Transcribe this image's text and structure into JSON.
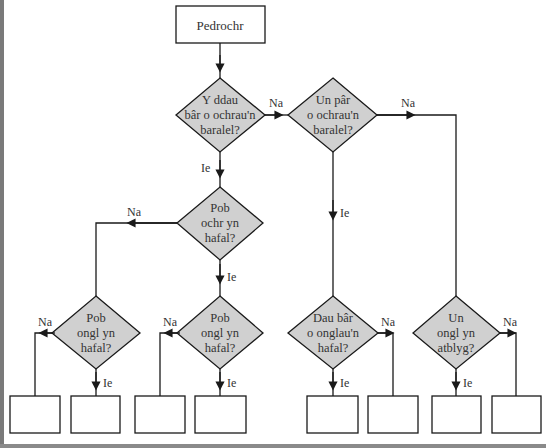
{
  "diagram": {
    "start": {
      "label": "Pedrochr"
    },
    "decisions": [
      {
        "id": "d1",
        "lines": [
          "Y ddau",
          "bâr o ochrau'n",
          "baralel?"
        ]
      },
      {
        "id": "d2",
        "lines": [
          "Un pâr",
          "o ochrau'n",
          "baralel?"
        ]
      },
      {
        "id": "d3",
        "lines": [
          "Pob",
          "ochr yn",
          "hafal?"
        ]
      },
      {
        "id": "d4",
        "lines": [
          "Pob",
          "ongl yn",
          "hafal?"
        ]
      },
      {
        "id": "d5",
        "lines": [
          "Pob",
          "ongl yn",
          "hafal?"
        ]
      },
      {
        "id": "d6",
        "lines": [
          "Dau bâr",
          "o onglau'n",
          "hafal?"
        ]
      },
      {
        "id": "d7",
        "lines": [
          "Un",
          "ongl yn",
          "atblyg?"
        ]
      }
    ],
    "edge_labels": {
      "yes": "Ie",
      "no": "Na"
    },
    "edges": [
      {
        "from": "start",
        "to": "d1",
        "label": ""
      },
      {
        "from": "d1",
        "to": "d2",
        "label": "Na"
      },
      {
        "from": "d1",
        "to": "d3",
        "label": "Ie"
      },
      {
        "from": "d2",
        "to": "d6",
        "label": "Ie"
      },
      {
        "from": "d2",
        "to": "d7",
        "label": "Na"
      },
      {
        "from": "d3",
        "to": "d4",
        "label": "Na"
      },
      {
        "from": "d3",
        "to": "d5",
        "label": "Ie"
      },
      {
        "from": "d4",
        "to": "box1",
        "label": "Na"
      },
      {
        "from": "d4",
        "to": "box2",
        "label": "Ie"
      },
      {
        "from": "d5",
        "to": "box3",
        "label": "Na"
      },
      {
        "from": "d5",
        "to": "box4",
        "label": "Ie"
      },
      {
        "from": "d6",
        "to": "box5",
        "label": "Ie"
      },
      {
        "from": "d6",
        "to": "box6",
        "label": "Na"
      },
      {
        "from": "d7",
        "to": "box7",
        "label": "Ie"
      },
      {
        "from": "d7",
        "to": "box8",
        "label": "Na"
      }
    ],
    "answer_boxes": [
      "",
      "",
      "",
      "",
      "",
      "",
      "",
      ""
    ],
    "colors": {
      "decision_fill": "#d0d0d0",
      "stroke": "#1a1a1a",
      "text": "#333333",
      "frame_gray": "#7a7a7a"
    }
  }
}
